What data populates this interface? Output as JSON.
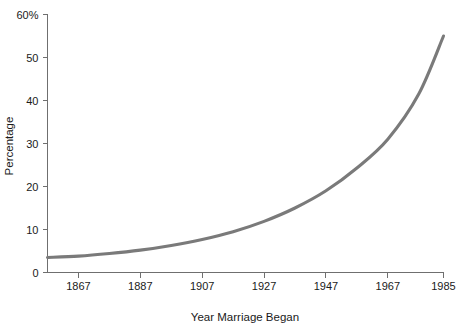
{
  "chart_data": {
    "type": "line",
    "title": "",
    "xlabel": "Year Marriage Began",
    "ylabel": "Percentage",
    "xlim": [
      1857,
      1985
    ],
    "ylim": [
      0,
      60
    ],
    "grid": false,
    "legend": null,
    "x_ticks": [
      1867,
      1887,
      1907,
      1927,
      1947,
      1967,
      1985
    ],
    "x_tick_labels": [
      "1867",
      "1887",
      "1907",
      "1927",
      "1947",
      "1967",
      "1985"
    ],
    "y_ticks": [
      0,
      10,
      20,
      30,
      40,
      50,
      60
    ],
    "y_tick_labels": [
      "0",
      "10",
      "20",
      "30",
      "40",
      "50",
      "60%"
    ],
    "series": [
      {
        "name": "Percentage",
        "color": "#7a7a7a",
        "x": [
          1857,
          1867,
          1877,
          1887,
          1897,
          1907,
          1917,
          1927,
          1937,
          1947,
          1957,
          1967,
          1977,
          1985
        ],
        "y": [
          3.5,
          3.8,
          4.4,
          5.2,
          6.3,
          7.7,
          9.5,
          11.9,
          15.0,
          19.0,
          24.3,
          31.0,
          41.5,
          55.0
        ]
      }
    ]
  },
  "axis_labels": {
    "x_title": "Year Marriage Began",
    "y_title": "Percentage"
  },
  "colors": {
    "curve": "#7a7a7a",
    "axis": "#6f6f6f",
    "text": "#1a1a1a",
    "background": "#ffffff"
  }
}
